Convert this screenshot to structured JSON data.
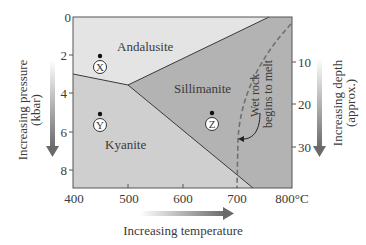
{
  "diagram": {
    "title": "",
    "x_axis": {
      "label": "Increasing temperature",
      "ticks": [
        "400",
        "500",
        "600",
        "700",
        "800°C"
      ],
      "values": [
        400,
        500,
        600,
        700,
        800
      ],
      "unit": "°C"
    },
    "y_axis_left": {
      "label_line1": "Increasing pressure",
      "label_line2": "(kbar)",
      "ticks": [
        "0",
        "2",
        "4",
        "6",
        "8"
      ],
      "values": [
        0,
        2,
        4,
        6,
        8
      ]
    },
    "y_axis_right": {
      "label_line1": "Increasing depth",
      "label_line2": "(approx.)",
      "ticks": [
        "10",
        "20",
        "30"
      ],
      "values": [
        10,
        20,
        30
      ]
    },
    "regions": {
      "andalusite": "Andalusite",
      "kyanite": "Kyanite",
      "sillimanite": "Sillimanite"
    },
    "melt_curve_label_line1": "Wet rock",
    "melt_curve_label_line2": "begins to melt",
    "markers": [
      {
        "label": "X",
        "temp_c": 450,
        "pressure_kbar": 2.5
      },
      {
        "label": "Y",
        "temp_c": 450,
        "pressure_kbar": 5.3
      },
      {
        "label": "Z",
        "temp_c": 650,
        "pressure_kbar": 5.5
      }
    ],
    "triple_point": {
      "temp_c": 500,
      "pressure_kbar": 3.7
    },
    "colors": {
      "andalusite_fill": "#e4e4e4",
      "kyanite_fill": "#cfcfcf",
      "sillimanite_fill": "#b3b3b3",
      "boundary_line": "#3a3a3a",
      "melt_curve": "#707070",
      "arrow": "#6e6e6e"
    }
  }
}
